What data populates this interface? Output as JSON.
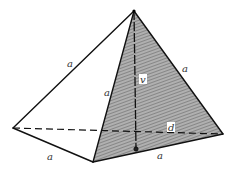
{
  "figure": {
    "labels": {
      "edge_top_left": "a",
      "edge_front": "a",
      "edge_top_right": "a",
      "edge_base_left": "a",
      "edge_base_front": "a",
      "height": "v",
      "diagonal": "d"
    },
    "colors": {
      "line": "#111111",
      "hatch_fill": "#9a9a9a",
      "background": "#ffffff"
    }
  }
}
